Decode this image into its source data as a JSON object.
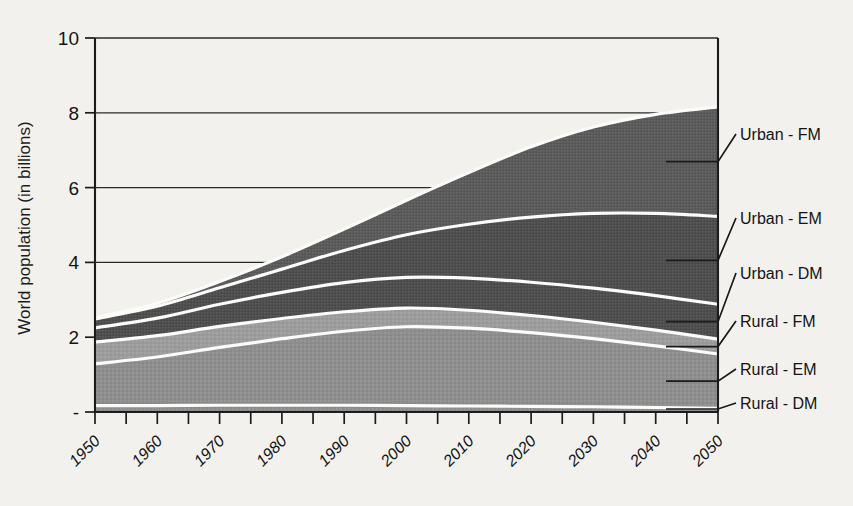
{
  "chart_data": {
    "type": "area",
    "title": "",
    "xlabel": "",
    "ylabel": "World population (in billions)",
    "xlim": [
      1950,
      2050
    ],
    "ylim": [
      0,
      10
    ],
    "ytick_labels": [
      "-",
      "2",
      "4",
      "6",
      "8",
      "10"
    ],
    "ytick_values": [
      0,
      2,
      4,
      6,
      8,
      10
    ],
    "grid": true,
    "grid_axis": "y",
    "legend_position": "right-outside",
    "stacked": true,
    "stack_order_bottom_to_top": [
      "Rural - DM",
      "Rural - EM",
      "Rural - FM",
      "Urban - DM",
      "Urban - EM",
      "Urban - FM"
    ],
    "x": [
      1950,
      1960,
      1970,
      1980,
      1990,
      2000,
      2010,
      2020,
      2030,
      2040,
      2050
    ],
    "series": [
      {
        "name": "Rural - DM",
        "label": "Rural - DM",
        "color": "#8e8e8e",
        "values": [
          0.17,
          0.17,
          0.18,
          0.18,
          0.18,
          0.17,
          0.16,
          0.15,
          0.14,
          0.12,
          0.1
        ]
      },
      {
        "name": "Rural - EM",
        "label": "Rural - EM",
        "color": "#8e8e8e",
        "values": [
          1.12,
          1.3,
          1.55,
          1.78,
          1.98,
          2.11,
          2.08,
          1.97,
          1.82,
          1.65,
          1.45
        ]
      },
      {
        "name": "Rural - FM",
        "label": "Rural - FM",
        "color": "#9c9c9c",
        "values": [
          0.58,
          0.57,
          0.56,
          0.54,
          0.52,
          0.5,
          0.48,
          0.46,
          0.44,
          0.42,
          0.4
        ]
      },
      {
        "name": "Urban - DM",
        "label": "Urban - DM",
        "color": "#4d4d4d",
        "values": [
          0.38,
          0.47,
          0.59,
          0.7,
          0.78,
          0.82,
          0.86,
          0.89,
          0.91,
          0.92,
          0.93
        ]
      },
      {
        "name": "Urban - EM",
        "label": "Urban - EM",
        "color": "#4d4d4d",
        "values": [
          0.24,
          0.32,
          0.44,
          0.62,
          0.86,
          1.14,
          1.44,
          1.74,
          2.0,
          2.2,
          2.35
        ]
      },
      {
        "name": "Urban - FM",
        "label": "Urban - FM",
        "color": "#5a5a5a",
        "values": [
          0.03,
          0.08,
          0.17,
          0.33,
          0.57,
          0.92,
          1.38,
          1.88,
          2.31,
          2.65,
          2.93
        ]
      }
    ],
    "totals": [
      2.52,
      2.91,
      3.49,
      4.15,
      4.89,
      5.66,
      6.4,
      7.09,
      7.62,
      7.96,
      8.16
    ],
    "legend_entries": [
      {
        "label": "Urban - FM"
      },
      {
        "label": "Urban - EM"
      },
      {
        "label": "Urban - DM"
      },
      {
        "label": "Rural - FM"
      },
      {
        "label": "Rural - EM"
      },
      {
        "label": "Rural - DM"
      }
    ],
    "xtick_labels": [
      "1950",
      "1960",
      "1970",
      "1980",
      "1990",
      "2000",
      "2010",
      "2020",
      "2030",
      "2040",
      "2050"
    ]
  },
  "colors": {
    "background": "#f2f1ee",
    "axis": "#1c1c1c",
    "separator": "#fbfbfa",
    "dark_band": "#4d4d4d",
    "mid_band": "#9c9c9c",
    "light_band": "#8e8e8e"
  }
}
